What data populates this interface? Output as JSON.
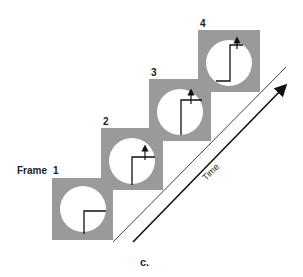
{
  "frames": [
    {
      "label": "1",
      "prefix": "Frame"
    },
    {
      "label": "2"
    },
    {
      "label": "3"
    },
    {
      "label": "4"
    }
  ],
  "axis": {
    "label": "Time"
  },
  "caption": "c.",
  "colors": {
    "frame_fill": "#9a9a9a",
    "circle_fill": "#ffffff",
    "line": "#111111"
  }
}
